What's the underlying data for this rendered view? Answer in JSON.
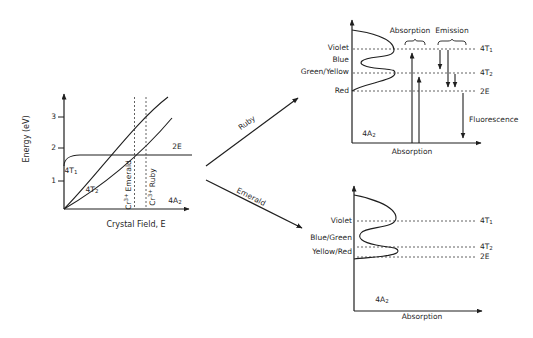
{
  "colors": {
    "ink": "#1f1f1f",
    "dash": "#3a3a3a",
    "bg": "#ffffff"
  },
  "levels": {
    "t1": {
      "base": "4T",
      "sub": "1"
    },
    "t2": {
      "base": "4T",
      "sub": "2"
    },
    "e": "2E",
    "a2": {
      "base": "4A",
      "sub": "2"
    }
  },
  "left_plot": {
    "y_axis_label": "Energy (eV)",
    "x_axis_label": "Crystal Field, E",
    "y_ticks": [
      "3",
      "2",
      "1"
    ],
    "emerald_line_label": {
      "pre": "Cr",
      "sup": "3+",
      "post": "Emerald"
    },
    "ruby_line_label": {
      "pre": "Cr",
      "sup": "3+",
      "post": "Ruby"
    }
  },
  "connectors": {
    "ruby_label": "Ruby",
    "emerald_label": "Emerald"
  },
  "ruby_diagram": {
    "band_labels": [
      "Violet",
      "Blue",
      "Green/Yellow",
      "Red"
    ],
    "absorption_label": "Absorption",
    "emission_label": "Emission",
    "fluorescence_label": "Fluorescence",
    "x_axis_label": "Absorption"
  },
  "emerald_diagram": {
    "band_labels": [
      "Violet",
      "Blue/Green",
      "Yellow/Red"
    ],
    "x_axis_label": "Absorption"
  }
}
